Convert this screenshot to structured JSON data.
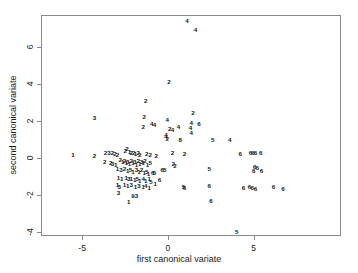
{
  "chart_data": {
    "type": "scatter",
    "title": "",
    "xlabel": "first canonical variate",
    "ylabel": "second canonical variate",
    "xlim": [
      -7.4,
      10.1
    ],
    "ylim": [
      -4.2,
      7.7
    ],
    "xticks": [
      -5,
      0,
      5
    ],
    "xticklabels": [
      "-5",
      "0",
      "5"
    ],
    "yticks": [
      6,
      4,
      2,
      0,
      -2,
      -4
    ],
    "yticklabels": [
      "6",
      "4",
      "2",
      "0",
      "-2",
      "-4"
    ],
    "grid": false,
    "legend": null,
    "marker_style": "group-number-as-text-label",
    "groups": [
      "1",
      "2",
      "3",
      "4",
      "5",
      "6"
    ],
    "points": [
      {
        "label": "4",
        "x": 1.05,
        "y": 7.45
      },
      {
        "label": "4",
        "x": 1.55,
        "y": 6.95
      },
      {
        "label": "2",
        "x": 0.0,
        "y": 4.15
      },
      {
        "label": "2",
        "x": -1.35,
        "y": 3.15
      },
      {
        "label": "3",
        "x": -4.35,
        "y": 2.2
      },
      {
        "label": "2",
        "x": -1.45,
        "y": 2.25
      },
      {
        "label": "2",
        "x": 1.4,
        "y": 2.5
      },
      {
        "label": "4",
        "x": -0.1,
        "y": 2.1
      },
      {
        "label": "4",
        "x": 1.3,
        "y": 1.95
      },
      {
        "label": "6",
        "x": 1.75,
        "y": 1.9
      },
      {
        "label": "4",
        "x": -1.0,
        "y": 1.9
      },
      {
        "label": "4",
        "x": -0.85,
        "y": 1.85
      },
      {
        "label": "2",
        "x": -1.5,
        "y": 1.75
      },
      {
        "label": "4",
        "x": 0.55,
        "y": 1.7
      },
      {
        "label": "4",
        "x": 1.25,
        "y": 1.65
      },
      {
        "label": "2",
        "x": 0.05,
        "y": 1.6
      },
      {
        "label": "4",
        "x": 0.2,
        "y": 1.55
      },
      {
        "label": "4",
        "x": 1.3,
        "y": 1.4
      },
      {
        "label": "4",
        "x": -0.18,
        "y": 1.3
      },
      {
        "label": "4",
        "x": -0.18,
        "y": 1.2
      },
      {
        "label": "2",
        "x": -0.1,
        "y": 1.1
      },
      {
        "label": "8",
        "x": 0.65,
        "y": 1.05
      },
      {
        "label": "5",
        "x": 2.55,
        "y": 1.05
      },
      {
        "label": "4",
        "x": 3.55,
        "y": 1.0
      },
      {
        "label": "1",
        "x": -5.6,
        "y": 0.2
      },
      {
        "label": "2",
        "x": -4.35,
        "y": 0.15
      },
      {
        "label": "2",
        "x": -3.7,
        "y": 0.3
      },
      {
        "label": "3",
        "x": -3.5,
        "y": 0.32
      },
      {
        "label": "2",
        "x": -3.3,
        "y": 0.3
      },
      {
        "label": "2",
        "x": -3.15,
        "y": 0.25
      },
      {
        "label": "2",
        "x": -3.0,
        "y": 0.2
      },
      {
        "label": "2",
        "x": -2.55,
        "y": 0.45
      },
      {
        "label": "2",
        "x": -2.45,
        "y": 0.55
      },
      {
        "label": "1",
        "x": -2.3,
        "y": 0.4
      },
      {
        "label": "2",
        "x": -2.2,
        "y": 0.35
      },
      {
        "label": "2",
        "x": -2.05,
        "y": 0.3
      },
      {
        "label": "1",
        "x": -1.95,
        "y": 0.25
      },
      {
        "label": "2",
        "x": -1.8,
        "y": 0.3
      },
      {
        "label": "2",
        "x": -1.7,
        "y": 0.2
      },
      {
        "label": "2",
        "x": -1.3,
        "y": 0.25
      },
      {
        "label": "2",
        "x": -1.1,
        "y": 0.2
      },
      {
        "label": "2",
        "x": -0.75,
        "y": 0.15
      },
      {
        "label": "2",
        "x": 0.2,
        "y": 0.3
      },
      {
        "label": "2",
        "x": 0.9,
        "y": 0.25
      },
      {
        "label": "6",
        "x": 4.15,
        "y": 0.25
      },
      {
        "label": "6",
        "x": 4.75,
        "y": 0.3
      },
      {
        "label": "6",
        "x": 4.9,
        "y": 0.32
      },
      {
        "label": "6",
        "x": 5.05,
        "y": 0.3
      },
      {
        "label": "6",
        "x": 5.35,
        "y": 0.3
      },
      {
        "label": "2",
        "x": -3.75,
        "y": -0.15
      },
      {
        "label": "2",
        "x": -3.4,
        "y": -0.2
      },
      {
        "label": "3",
        "x": -3.3,
        "y": -0.25
      },
      {
        "label": "1",
        "x": -3.1,
        "y": -0.3
      },
      {
        "label": "2",
        "x": -2.85,
        "y": -0.05
      },
      {
        "label": "1",
        "x": -2.7,
        "y": -0.15
      },
      {
        "label": "2",
        "x": -2.6,
        "y": -0.1
      },
      {
        "label": "1",
        "x": -2.5,
        "y": -0.2
      },
      {
        "label": "3",
        "x": -2.4,
        "y": -0.15
      },
      {
        "label": "1",
        "x": -2.3,
        "y": -0.25
      },
      {
        "label": "2",
        "x": -2.2,
        "y": -0.1
      },
      {
        "label": "1",
        "x": -2.1,
        "y": -0.2
      },
      {
        "label": "3",
        "x": -2.0,
        "y": -0.15
      },
      {
        "label": "1",
        "x": -1.9,
        "y": -0.3
      },
      {
        "label": "2",
        "x": -1.8,
        "y": -0.1
      },
      {
        "label": "1",
        "x": -1.7,
        "y": -0.25
      },
      {
        "label": "3",
        "x": -1.6,
        "y": -0.15
      },
      {
        "label": "1",
        "x": -1.5,
        "y": -0.2
      },
      {
        "label": "2",
        "x": -1.4,
        "y": -0.1
      },
      {
        "label": "1",
        "x": -1.25,
        "y": -0.3
      },
      {
        "label": "5",
        "x": -1.1,
        "y": -0.2
      },
      {
        "label": "2",
        "x": 0.25,
        "y": -0.25
      },
      {
        "label": "2",
        "x": 0.35,
        "y": -0.4
      },
      {
        "label": "6",
        "x": 5.0,
        "y": -0.45
      },
      {
        "label": "6",
        "x": 5.15,
        "y": -0.5
      },
      {
        "label": "6",
        "x": 4.95,
        "y": -0.65
      },
      {
        "label": "6",
        "x": 5.4,
        "y": -0.65
      },
      {
        "label": "5",
        "x": 2.35,
        "y": -0.55
      },
      {
        "label": "6",
        "x": -0.4,
        "y": -0.6
      },
      {
        "label": "5",
        "x": -0.25,
        "y": -0.6
      },
      {
        "label": "1",
        "x": -3.0,
        "y": -0.55
      },
      {
        "label": "3",
        "x": -2.8,
        "y": -0.6
      },
      {
        "label": "2",
        "x": -2.6,
        "y": -0.55
      },
      {
        "label": "1",
        "x": -2.4,
        "y": -0.65
      },
      {
        "label": "5",
        "x": -2.25,
        "y": -0.6
      },
      {
        "label": "1",
        "x": -2.1,
        "y": -0.7
      },
      {
        "label": "3",
        "x": -1.9,
        "y": -0.6
      },
      {
        "label": "1",
        "x": -1.75,
        "y": -0.7
      },
      {
        "label": "2",
        "x": -1.6,
        "y": -0.6
      },
      {
        "label": "1",
        "x": -1.45,
        "y": -0.75
      },
      {
        "label": "5",
        "x": -1.3,
        "y": -0.7
      },
      {
        "label": "1",
        "x": -1.2,
        "y": -0.8
      },
      {
        "label": "6",
        "x": -0.95,
        "y": -0.75
      },
      {
        "label": "5",
        "x": -0.85,
        "y": -0.75
      },
      {
        "label": "1",
        "x": -2.95,
        "y": -1.0
      },
      {
        "label": "1",
        "x": -2.75,
        "y": -1.05
      },
      {
        "label": "1",
        "x": -2.5,
        "y": -1.0
      },
      {
        "label": "3",
        "x": -2.35,
        "y": -1.1
      },
      {
        "label": "1",
        "x": -2.2,
        "y": -1.05
      },
      {
        "label": "1",
        "x": -2.0,
        "y": -1.15
      },
      {
        "label": "5",
        "x": -1.85,
        "y": -1.1
      },
      {
        "label": "1",
        "x": -1.7,
        "y": -1.2
      },
      {
        "label": "4",
        "x": -1.5,
        "y": -1.1
      },
      {
        "label": "1",
        "x": -1.35,
        "y": -1.2
      },
      {
        "label": "1",
        "x": -1.15,
        "y": -1.1
      },
      {
        "label": "5",
        "x": -1.05,
        "y": -1.25
      },
      {
        "label": "6",
        "x": -0.55,
        "y": -1.15
      },
      {
        "label": "1",
        "x": -3.0,
        "y": -1.4
      },
      {
        "label": "3",
        "x": -2.9,
        "y": -1.5
      },
      {
        "label": "1",
        "x": -2.6,
        "y": -1.4
      },
      {
        "label": "1",
        "x": -2.4,
        "y": -1.45
      },
      {
        "label": "3",
        "x": -2.2,
        "y": -1.4
      },
      {
        "label": "1",
        "x": -1.95,
        "y": -1.5
      },
      {
        "label": "3",
        "x": -1.75,
        "y": -1.45
      },
      {
        "label": "1",
        "x": -1.5,
        "y": -1.5
      },
      {
        "label": "4",
        "x": -1.35,
        "y": -1.45
      },
      {
        "label": "1",
        "x": -1.15,
        "y": -1.55
      },
      {
        "label": "1",
        "x": -0.8,
        "y": -1.35
      },
      {
        "label": "5",
        "x": 0.85,
        "y": -1.5
      },
      {
        "label": "6",
        "x": 0.9,
        "y": -1.55
      },
      {
        "label": "6",
        "x": 2.35,
        "y": -1.45
      },
      {
        "label": "6",
        "x": 4.35,
        "y": -1.55
      },
      {
        "label": "6",
        "x": 4.7,
        "y": -1.5
      },
      {
        "label": "6",
        "x": 4.85,
        "y": -1.55
      },
      {
        "label": "6",
        "x": 5.05,
        "y": -1.6
      },
      {
        "label": "6",
        "x": 6.1,
        "y": -1.5
      },
      {
        "label": "6",
        "x": 6.65,
        "y": -1.6
      },
      {
        "label": "3",
        "x": -2.95,
        "y": -1.85
      },
      {
        "label": "9",
        "x": -2.1,
        "y": -2.0
      },
      {
        "label": "3",
        "x": -1.9,
        "y": -2.0
      },
      {
        "label": "1",
        "x": -2.35,
        "y": -2.3
      },
      {
        "label": "6",
        "x": 2.45,
        "y": -2.25
      },
      {
        "label": "5",
        "x": 3.95,
        "y": -3.95
      }
    ]
  },
  "axes": {
    "x_title": "first canonical variate",
    "y_title": "second canonical variate"
  }
}
